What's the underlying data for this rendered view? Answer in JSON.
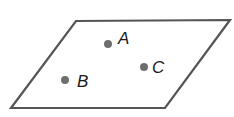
{
  "diagram": {
    "type": "plane-with-points",
    "shape": "parallelogram",
    "colors": {
      "outline": "#555555",
      "point": "#6e6e6e",
      "label": "#1a1a1a",
      "background": "#ffffff"
    },
    "plane": {
      "vertices": [
        [
          76,
          21
        ],
        [
          230,
          20
        ],
        [
          165,
          108
        ],
        [
          11,
          108
        ]
      ]
    },
    "points": [
      {
        "name": "A",
        "label": "A",
        "x": 108,
        "y": 44,
        "label_x": 118,
        "label_y": 44
      },
      {
        "name": "B",
        "label": "B",
        "x": 65,
        "y": 80,
        "label_x": 77,
        "label_y": 87
      },
      {
        "name": "C",
        "label": "C",
        "x": 144,
        "y": 67,
        "label_x": 152,
        "label_y": 73
      }
    ]
  }
}
